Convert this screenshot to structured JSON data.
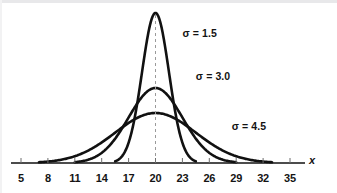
{
  "figure": {
    "background_color": "#ffffff",
    "stroke_color": "#111111",
    "axis_label": "x",
    "mean_line_style": "dashed"
  },
  "chart_data": {
    "type": "line",
    "title": "",
    "subtitle": "",
    "xlabel": "x",
    "ylabel": "",
    "xlim": [
      5,
      35
    ],
    "ylim": [
      0,
      0.28
    ],
    "grid": false,
    "legend_position": "inline-annotations",
    "x_ticks": [
      5,
      8,
      11,
      14,
      17,
      20,
      23,
      26,
      29,
      32,
      35
    ],
    "x_tick_labels": [
      "5",
      "8",
      "11",
      "14",
      "17",
      "20",
      "23",
      "26",
      "29",
      "32",
      "35"
    ],
    "mean": 20,
    "mean_marker": {
      "value": 20,
      "label": "20",
      "style": "dashed vertical line"
    },
    "series": [
      {
        "name": "sigma-1.5",
        "label": "σ = 1.5",
        "sigma": 1.5,
        "mu": 20,
        "peak_value": 0.266,
        "visible_domain": [
          15.5,
          24.5
        ],
        "annotation_x": 23.0,
        "annotation_y": 0.228
      },
      {
        "name": "sigma-3.0",
        "label": "σ = 3.0",
        "sigma": 3.0,
        "mu": 20,
        "peak_value": 0.133,
        "visible_domain": [
          11.0,
          29.0
        ],
        "annotation_x": 24.5,
        "annotation_y": 0.152
      },
      {
        "name": "sigma-4.5",
        "label": "σ = 4.5",
        "sigma": 4.5,
        "mu": 20,
        "peak_value": 0.0887,
        "visible_domain": [
          7.0,
          33.0
        ],
        "annotation_x": 28.5,
        "annotation_y": 0.063
      }
    ]
  }
}
